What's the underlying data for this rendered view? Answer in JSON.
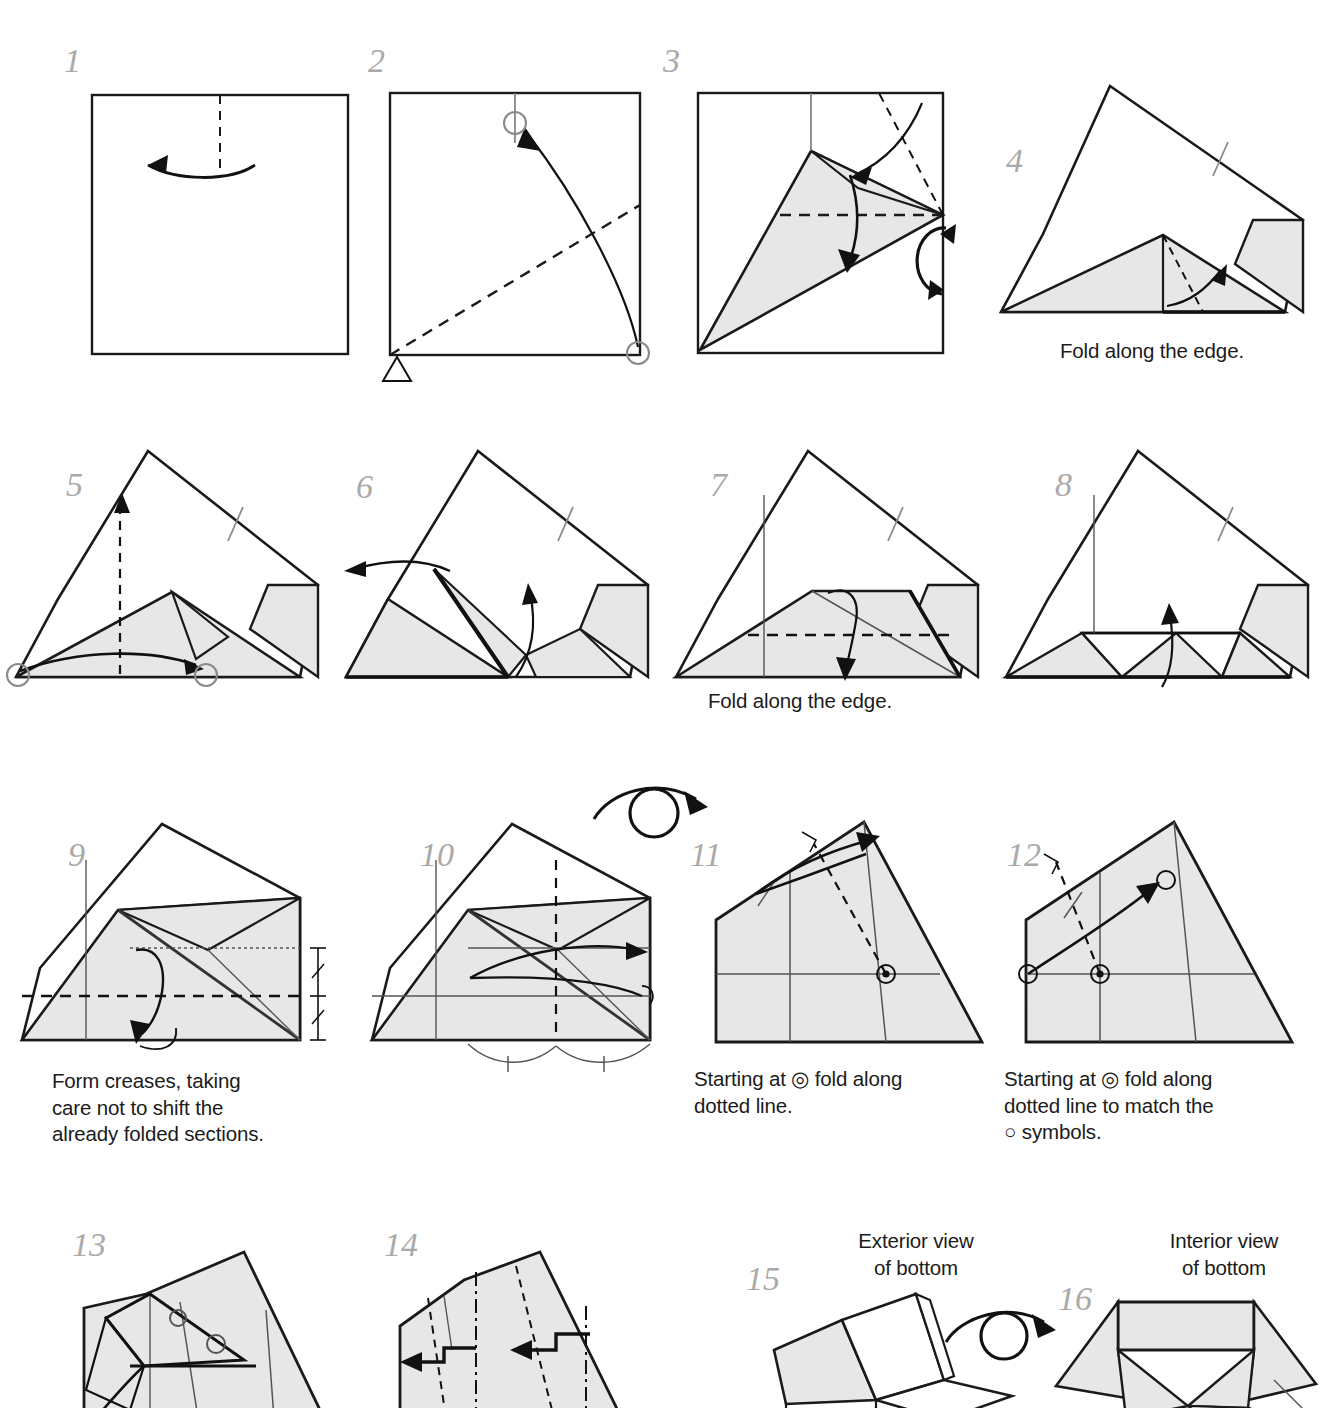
{
  "document": {
    "kind": "origami-diagram-page",
    "top_cropped_text": "",
    "paper_fill": "#e7e7e7",
    "line_color": "#1a1a1a",
    "step_number_color": "#a9a9a9",
    "caption_color": "#1b1b1b"
  },
  "steps": [
    {
      "number": "1",
      "caption": ""
    },
    {
      "number": "2",
      "caption": ""
    },
    {
      "number": "3",
      "caption": ""
    },
    {
      "number": "4",
      "caption": "Fold along the edge."
    },
    {
      "number": "5",
      "caption": ""
    },
    {
      "number": "6",
      "caption": ""
    },
    {
      "number": "7",
      "caption": "Fold along the edge."
    },
    {
      "number": "8",
      "caption": ""
    },
    {
      "number": "9",
      "caption": "Form creases, taking\ncare not to shift the\nalready folded sections."
    },
    {
      "number": "10",
      "caption": ""
    },
    {
      "number": "11",
      "caption": "Starting at ◎ fold along\ndotted line."
    },
    {
      "number": "12",
      "caption": "Starting at ◎ fold along\ndotted line to match the\n○ symbols."
    },
    {
      "number": "13",
      "caption": ""
    },
    {
      "number": "14",
      "caption": ""
    },
    {
      "number": "15",
      "caption": ""
    },
    {
      "number": "16",
      "caption": ""
    }
  ],
  "labels": {
    "exterior_view": "Exterior view\nof bottom",
    "interior_view": "Interior view\nof bottom"
  },
  "symbols": {
    "rotate_icon": "rotate-180-icon",
    "turn_over_icon": "turn-over-icon",
    "reference_circle": "reference-circle-symbol",
    "target_circle": "target-bullseye-symbol",
    "right_angle": "right-angle-marker",
    "equal_tick": "equal-length-tick",
    "triangle_marker": "alignment-triangle-marker"
  }
}
